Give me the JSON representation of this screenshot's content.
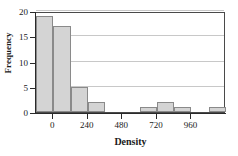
{
  "chart_data": {
    "type": "bar",
    "title": "",
    "subtitle": "",
    "xlabel": "Density",
    "ylabel": "Frequency",
    "grid": true,
    "legend": false,
    "legend_position": "none",
    "xlim": [
      -120,
      1200
    ],
    "ylim": [
      0,
      20
    ],
    "bin_width": 120,
    "x_ticks": [
      0,
      240,
      480,
      720,
      960
    ],
    "x_tick_labels": [
      "0",
      "240",
      "480",
      "720",
      "960"
    ],
    "y_ticks": [
      0,
      5,
      10,
      15,
      20
    ],
    "y_tick_labels": [
      "0",
      "5",
      "10",
      "15",
      "20"
    ],
    "bins": [
      {
        "start": -120,
        "end": 0,
        "value": 19
      },
      {
        "start": 0,
        "end": 120,
        "value": 17
      },
      {
        "start": 120,
        "end": 240,
        "value": 5
      },
      {
        "start": 240,
        "end": 360,
        "value": 2
      },
      {
        "start": 360,
        "end": 480,
        "value": 0
      },
      {
        "start": 480,
        "end": 600,
        "value": 0
      },
      {
        "start": 600,
        "end": 720,
        "value": 1
      },
      {
        "start": 720,
        "end": 840,
        "value": 2
      },
      {
        "start": 840,
        "end": 960,
        "value": 1
      },
      {
        "start": 960,
        "end": 1080,
        "value": 0
      },
      {
        "start": 1080,
        "end": 1200,
        "value": 1
      }
    ],
    "categories": [
      "-120",
      "0",
      "120",
      "240",
      "360",
      "480",
      "600",
      "720",
      "840",
      "960",
      "1080"
    ],
    "values": [
      19,
      17,
      5,
      2,
      0,
      0,
      1,
      2,
      1,
      0,
      1
    ]
  },
  "style": {
    "bar_fill": "#d4d4d4",
    "bar_border": "#8a8a8a",
    "grid_color": "#c8c8c8",
    "axis_color": "#2a2a2a",
    "frame_color": "#4a4a4a",
    "background": "#ffffff"
  }
}
